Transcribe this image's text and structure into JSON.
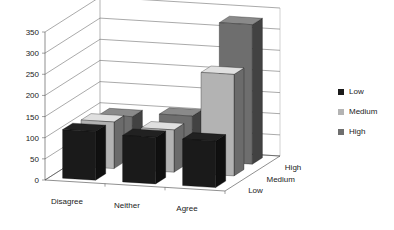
{
  "chart_data": {
    "type": "bar",
    "subtype": "3d-clustered-column",
    "title": "",
    "xlabel": "",
    "ylabel": "",
    "categories": [
      "Disagree",
      "Neither",
      "Agree"
    ],
    "depth_categories": [
      "Low",
      "Medium",
      "High"
    ],
    "series": [
      {
        "name": "Low",
        "color": "#1a1a1a",
        "values": [
          115,
          110,
          110
        ]
      },
      {
        "name": "Medium",
        "color": "#b3b3b3",
        "values": [
          110,
          100,
          240
        ]
      },
      {
        "name": "High",
        "color": "#6e6e6e",
        "values": [
          95,
          105,
          330
        ]
      }
    ],
    "ylim": [
      0,
      350
    ],
    "yticks": [
      "0",
      "50",
      "100",
      "150",
      "200",
      "250",
      "300",
      "350"
    ],
    "grid": true,
    "legend_position": "right"
  },
  "legend": {
    "items": [
      {
        "label": "Low",
        "color": "#1a1a1a"
      },
      {
        "label": "Medium",
        "color": "#b3b3b3"
      },
      {
        "label": "High",
        "color": "#6e6e6e"
      }
    ]
  }
}
